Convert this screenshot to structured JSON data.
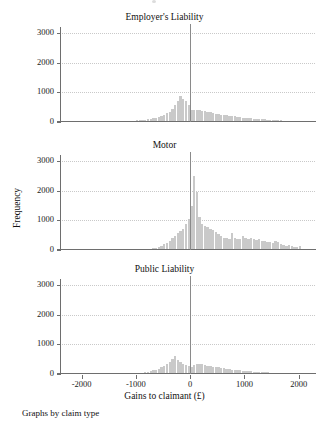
{
  "figure": {
    "footnote": "Graphs by claim type",
    "y_axis_title": "Frequency",
    "x_axis_title": "Gains to claimant (£)",
    "bar_color": "#c9c9c9",
    "axis_color": "#6e6e6e",
    "grid_color": "#c9c9c9",
    "zero_line_color": "#8a8a8a"
  },
  "chart_data": {
    "type": "bar",
    "title": "",
    "subtitle": "",
    "xlabel": "Gains to claimant (£)",
    "ylabel": "Frequency",
    "xlim": [
      -2400,
      2300
    ],
    "ylim": [
      0,
      3200
    ],
    "xticks": [
      -2000,
      -1000,
      0,
      1000,
      2000
    ],
    "xtick_labels": [
      "-2000",
      "-1000",
      "0",
      "1000",
      "2000"
    ],
    "yticks": [
      0,
      1000,
      2000,
      3000
    ],
    "ytick_labels": [
      "0",
      "1000",
      "2000",
      "3000"
    ],
    "grid": "horizontal-dotted",
    "legend": "none",
    "annotation": "vertical reference line at x = 0 in every panel",
    "bin_width": 50,
    "panels": [
      {
        "label": "Employer's Liability",
        "x": [
          -1250,
          -1200,
          -1150,
          -1100,
          -1050,
          -1000,
          -950,
          -900,
          -850,
          -800,
          -750,
          -700,
          -650,
          -600,
          -550,
          -500,
          -450,
          -400,
          -350,
          -300,
          -250,
          -200,
          -150,
          -100,
          -50,
          0,
          50,
          100,
          150,
          200,
          250,
          300,
          350,
          400,
          450,
          500,
          550,
          600,
          650,
          700,
          750,
          800,
          850,
          900,
          950,
          1000,
          1050,
          1100,
          1150,
          1200,
          1250,
          1300,
          1350,
          1400,
          1450,
          1500,
          1550,
          1600,
          1650,
          1700,
          1750,
          1800,
          1850,
          1900,
          1950,
          2000
        ],
        "values": [
          20,
          25,
          30,
          35,
          40,
          55,
          65,
          70,
          80,
          90,
          100,
          120,
          140,
          170,
          200,
          240,
          290,
          350,
          430,
          560,
          700,
          890,
          760,
          700,
          560,
          420,
          400,
          390,
          400,
          380,
          360,
          330,
          330,
          300,
          280,
          260,
          250,
          240,
          230,
          215,
          200,
          190,
          175,
          165,
          150,
          140,
          130,
          120,
          110,
          105,
          100,
          95,
          88,
          82,
          76,
          70,
          65,
          60,
          55,
          50,
          46,
          42,
          38,
          34,
          30,
          26
        ]
      },
      {
        "label": "Motor",
        "x": [
          -1250,
          -1200,
          -1150,
          -1100,
          -1050,
          -1000,
          -950,
          -900,
          -850,
          -800,
          -750,
          -700,
          -650,
          -600,
          -550,
          -500,
          -450,
          -400,
          -350,
          -300,
          -250,
          -200,
          -150,
          -100,
          -50,
          0,
          50,
          100,
          150,
          200,
          250,
          300,
          350,
          400,
          450,
          500,
          550,
          600,
          650,
          700,
          750,
          800,
          850,
          900,
          950,
          1000,
          1050,
          1100,
          1150,
          1200,
          1250,
          1300,
          1350,
          1400,
          1450,
          1500,
          1550,
          1600,
          1650,
          1700,
          1750,
          1800,
          1850,
          1900,
          1950,
          2000
        ],
        "values": [
          10,
          12,
          14,
          16,
          18,
          20,
          25,
          30,
          35,
          40,
          50,
          60,
          75,
          95,
          130,
          190,
          250,
          310,
          400,
          480,
          560,
          640,
          720,
          880,
          1060,
          1480,
          2480,
          1960,
          1120,
          880,
          800,
          760,
          700,
          660,
          600,
          540,
          480,
          420,
          400,
          380,
          560,
          420,
          380,
          360,
          460,
          420,
          360,
          420,
          380,
          340,
          360,
          320,
          300,
          280,
          260,
          240,
          300,
          280,
          200,
          160,
          140,
          160,
          120,
          100,
          90,
          130
        ]
      },
      {
        "label": "Public Liability",
        "x": [
          -1250,
          -1200,
          -1150,
          -1100,
          -1050,
          -1000,
          -950,
          -900,
          -850,
          -800,
          -750,
          -700,
          -650,
          -600,
          -550,
          -500,
          -450,
          -400,
          -350,
          -300,
          -250,
          -200,
          -150,
          -100,
          -50,
          0,
          50,
          100,
          150,
          200,
          250,
          300,
          350,
          400,
          450,
          500,
          550,
          600,
          650,
          700,
          750,
          800,
          850,
          900,
          950,
          1000,
          1050,
          1100,
          1150,
          1200,
          1250,
          1300,
          1350,
          1400,
          1450,
          1500,
          1550,
          1600,
          1650,
          1700,
          1750,
          1800,
          1850,
          1900,
          1950,
          2000
        ],
        "values": [
          15,
          18,
          20,
          25,
          30,
          35,
          40,
          50,
          60,
          75,
          95,
          120,
          150,
          180,
          230,
          280,
          340,
          420,
          520,
          620,
          460,
          420,
          340,
          300,
          260,
          240,
          300,
          330,
          340,
          330,
          300,
          280,
          260,
          240,
          230,
          220,
          200,
          190,
          175,
          160,
          150,
          140,
          130,
          120,
          110,
          100,
          95,
          88,
          80,
          75,
          70,
          65,
          60,
          55,
          50,
          46,
          42,
          38,
          35,
          32,
          28,
          25,
          22,
          20,
          18,
          15
        ]
      }
    ]
  }
}
